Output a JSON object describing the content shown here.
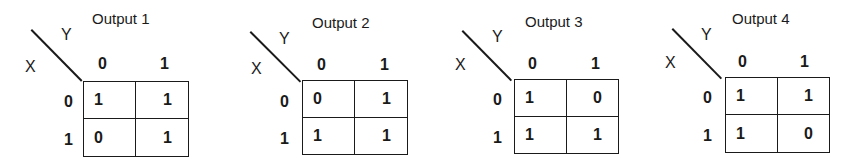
{
  "maps": [
    {
      "title": "Output 1",
      "row_var": "X",
      "col_var": "Y",
      "col_headers": [
        "0",
        "1"
      ],
      "row_headers": [
        "0",
        "1"
      ],
      "cells": [
        [
          "1",
          "1"
        ],
        [
          "0",
          "1"
        ]
      ]
    },
    {
      "title": "Output 2",
      "row_var": "X",
      "col_var": "Y",
      "col_headers": [
        "0",
        "1"
      ],
      "row_headers": [
        "0",
        "1"
      ],
      "cells": [
        [
          "0",
          "1"
        ],
        [
          "1",
          "1"
        ]
      ]
    },
    {
      "title": "Output 3",
      "row_var": "X",
      "col_var": "Y",
      "col_headers": [
        "0",
        "1"
      ],
      "row_headers": [
        "0",
        "1"
      ],
      "cells": [
        [
          "1",
          "0"
        ],
        [
          "1",
          "1"
        ]
      ]
    },
    {
      "title": "Output 4",
      "row_var": "X",
      "col_var": "Y",
      "col_headers": [
        "0",
        "1"
      ],
      "row_headers": [
        "0",
        "1"
      ],
      "cells": [
        [
          "1",
          "1"
        ],
        [
          "1",
          "0"
        ]
      ]
    }
  ]
}
